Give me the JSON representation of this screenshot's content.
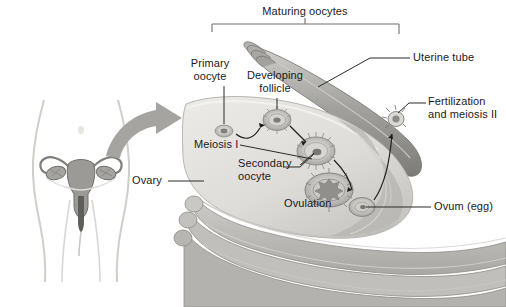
{
  "figure": {
    "background_color": "#ffffff",
    "width": 506,
    "height": 307
  },
  "palette": {
    "ink": "#1a1a1a",
    "leader_line": "#2b2b2b",
    "bracket": "#6e6e6e",
    "ovary_fill": "#e2e1de",
    "ovary_edge": "#b9b8b4",
    "tube_fill": "#a8a8a4",
    "tube_dark": "#7d7d79",
    "follicle_fill": "#bdbcb8",
    "follicle_core": "#8e8d89",
    "ligament_fill": "#bcbbb7",
    "body_outline": "#c9c8c5",
    "organ_fill": "#9d9c98",
    "pointer_arrow": "#9a9996"
  },
  "bracket": {
    "label": "Maturing oocytes",
    "left_x": 212,
    "right_x": 399,
    "y": 24,
    "tick_height": 8,
    "label_x": 305,
    "label_y": 6
  },
  "labels": [
    {
      "id": "primary-oocyte",
      "text": "Primary\noocyte",
      "x": 197,
      "y": 58,
      "align": "center",
      "leader": {
        "type": "vertical",
        "x": 224,
        "y1": 84,
        "y2": 130
      }
    },
    {
      "id": "developing-follicle",
      "text": "Developing\nfollicle",
      "x": 246,
      "y": 70,
      "align": "center",
      "leader": {
        "type": "vertical",
        "x": 277,
        "y1": 96,
        "y2": 117
      }
    },
    {
      "id": "uterine-tube",
      "text": "Uterine tube",
      "x": 413,
      "y": 52,
      "align": "left",
      "leader": {
        "type": "polyline",
        "points": "410,58 372,58 318,86"
      }
    },
    {
      "id": "fertilization-meiosis-2",
      "text": "Fertilization\nand meiosis II",
      "x": 428,
      "y": 96,
      "align": "left",
      "leader": {
        "type": "polyline",
        "points": "425,102 410,102 396,118"
      }
    },
    {
      "id": "meiosis-1",
      "text": "Meiosis I",
      "x": 194,
      "y": 139,
      "align": "left",
      "leader": {
        "type": "polyline",
        "points": "239,145 310,160"
      }
    },
    {
      "id": "secondary-oocyte",
      "text": "Secondary\noocyte",
      "x": 238,
      "y": 158,
      "align": "left",
      "leader": {
        "type": "polyline",
        "points": "304,164 317,152 309,152 312,150"
      }
    },
    {
      "id": "ovary",
      "text": "Ovary",
      "x": 132,
      "y": 175,
      "align": "left",
      "leader": {
        "type": "horizontal",
        "x1": 168,
        "x2": 203,
        "y": 181
      }
    },
    {
      "id": "ovulation",
      "text": "Ovulation",
      "x": 284,
      "y": 198,
      "align": "left",
      "leader": null
    },
    {
      "id": "ovum-egg",
      "text": "Ovum (egg)",
      "x": 434,
      "y": 201,
      "align": "left",
      "leader": {
        "type": "horizontal",
        "x1": 431,
        "x2": 360,
        "y": 207
      }
    }
  ],
  "structures": {
    "body_figure": {
      "name": "female reproductive anatomy inset",
      "organs": [
        "uterus",
        "uterine tubes",
        "ovaries",
        "vagina"
      ]
    },
    "pointer_arrow": {
      "name": "magnification arrow",
      "direction": "right"
    },
    "follicle_stages": [
      {
        "id": "primary-oocyte",
        "cx": 224,
        "cy": 131,
        "r": 9
      },
      {
        "id": "developing-follicle",
        "cx": 277,
        "cy": 120,
        "r": 13
      },
      {
        "id": "secondary-oocyte",
        "cx": 316,
        "cy": 151,
        "r": 17
      },
      {
        "id": "mature-follicle",
        "cx": 329,
        "cy": 190,
        "r": 22
      },
      {
        "id": "ovum",
        "cx": 362,
        "cy": 207,
        "r": 12
      },
      {
        "id": "fertilization",
        "cx": 396,
        "cy": 119,
        "r": 7
      }
    ],
    "stage_arrows": [
      "primary to developing",
      "developing to secondary",
      "secondary to mature",
      "ovulation to ovum",
      "ovum to fertilization"
    ]
  }
}
